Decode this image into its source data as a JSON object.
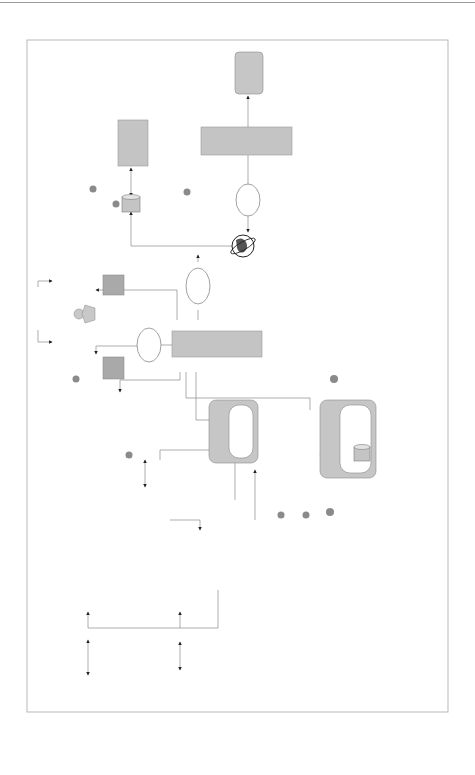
{
  "diagram": {
    "orientation": "rotated 90 degrees clockwise",
    "nodes": {
      "matching_app_b": [
        "Matching",
        "Application"
      ],
      "dealer_b": "Dealer B",
      "wsdl_top": [
        "WSDL",
        "Binding",
        "Information"
      ],
      "uddi_b2b_top": [
        "UDDI Registry",
        "for B2BI (Private)"
      ],
      "step7": [
        "Get Location",
        "and Bind",
        "Request"
      ],
      "step8": [
        "Web Services",
        "Request-",
        "Request for",
        "Trade Matching"
      ],
      "internet_right": "Internet",
      "clearing_corp": [
        "Clearing Corporation",
        "(MBSCC) RTM",
        "Application"
      ],
      "internet_mid": "Internet",
      "fixed_income_trader": [
        "Fixed Income",
        "Trader"
      ],
      "message_center": [
        "Message Center",
        "Application"
      ],
      "trading_app_top": [
        "Trading",
        "Application"
      ],
      "step1": [
        "Submit",
        "Trade Order"
      ],
      "internet_left": "Internet",
      "dealer_a": "Dealer A",
      "step2_top": [
        "Trade Information",
        "Passed Over"
      ],
      "j2ee_trading": [
        "J2EE-based",
        "Application Server"
      ],
      "j2ee_trading_inner": "Trading Application",
      "step5": [
        "Web Services Request-",
        "TradeInformation"
      ],
      "step6_resp": [
        "Web Services Response-",
        "Trade Create Acknowledgement"
      ],
      "j2ee_broker": [
        "J2EE-based",
        "Application Server"
      ],
      "j2ee_broker_inner": [
        "Message Broker",
        "(Web Services",
        "Provider Application)"
      ],
      "step12": [
        "Delivers the",
        "Message"
      ],
      "messages_repo": [
        "Messages",
        "Repository"
      ],
      "step11": [
        "Forwards the",
        "Message",
        "Received from",
        "MBSCC"
      ],
      "mainframe": "Mainframe",
      "mainframe_inner": [
        "Trading",
        "Application"
      ],
      "step2_bottom": [
        "Trade",
        "Information",
        "Passed Over"
      ],
      "j2ee_matching": [
        "J2EE-based",
        "Application Server"
      ],
      "j2ee_matching_inner": [
        "Matching",
        "Application"
      ],
      "uddi_b2b_bottom": [
        "UDDI Registry",
        "for B2BI (Private)"
      ],
      "step4": [
        "Get Location",
        "and",
        "Bind",
        "Request"
      ],
      "wsdl_bottom_left": [
        "WSDL",
        "Binding",
        "Information"
      ],
      "uddi_eai": [
        "UDDI Registry",
        "for EAI (Private)"
      ],
      "step10": [
        "Get Location",
        "and",
        "Bind",
        "Request"
      ],
      "wsdl_bottom_right": [
        "WSDL",
        "Binding",
        "Information"
      ]
    },
    "badges": {
      "b1": "1",
      "b2a": "2",
      "b2b": "2",
      "b3": "3",
      "b4": "4",
      "b5": "5",
      "b6": "6",
      "b7": "7",
      "b8": "8",
      "b9": "9",
      "b10": "10",
      "b11": "11",
      "b12": "12",
      "b6r": "6"
    },
    "colors": {
      "box_dark": "#a9a9a9",
      "box_round": "#c6c6c6",
      "line": "#8a8a8a",
      "badge": "#8a8a8a"
    }
  }
}
